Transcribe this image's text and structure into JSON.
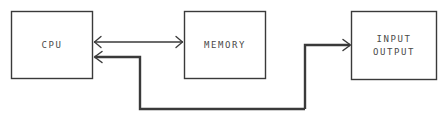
{
  "diagram": {
    "type": "block-diagram",
    "canvas": {
      "width": 446,
      "height": 118,
      "background": "#ffffff"
    },
    "stroke_color": "#3a3a3a",
    "text_color": "#4a4a4a",
    "blocks": [
      {
        "id": "cpu",
        "label": "CPU",
        "lines": [
          "CPU"
        ],
        "x": 11,
        "y": 11,
        "width": 82,
        "height": 68
      },
      {
        "id": "memory",
        "label": "MEMORY",
        "lines": [
          "MEMORY"
        ],
        "x": 184,
        "y": 11,
        "width": 82,
        "height": 68
      },
      {
        "id": "input_output",
        "label": "INPUT OUTPUT",
        "lines": [
          "INPUT",
          "OUTPUT"
        ],
        "x": 351,
        "y": 11,
        "width": 86,
        "height": 69
      }
    ],
    "connections": [
      {
        "id": "cpu-memory-bus",
        "from": "cpu",
        "to": "memory",
        "style": "double-arrow",
        "thickness": 1.3,
        "y": 42
      },
      {
        "id": "io-to-cpu-return",
        "from": "input_output",
        "to": "cpu",
        "style": "single-arrow",
        "thickness": 2.4,
        "path": "from bottom bus up into CPU right edge at y=57"
      },
      {
        "id": "bus-to-io",
        "from": "cpu",
        "to": "input_output",
        "style": "single-arrow",
        "thickness": 2.4,
        "path": "from bottom bus up to y=45 then right into I/O left edge"
      }
    ]
  }
}
